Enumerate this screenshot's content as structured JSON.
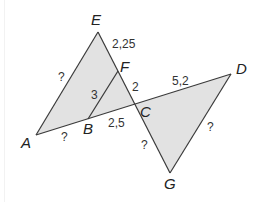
{
  "diagram": {
    "type": "geometry-figure",
    "colors": {
      "fill": "#e2e2e2",
      "stroke": "#3a3a3a",
      "text": "#222222"
    },
    "points": {
      "A": {
        "x": 36,
        "y": 135
      },
      "B": {
        "x": 88,
        "y": 119
      },
      "C": {
        "x": 135,
        "y": 104
      },
      "D": {
        "x": 231,
        "y": 74
      },
      "E": {
        "x": 98,
        "y": 32
      },
      "F": {
        "x": 118,
        "y": 71
      },
      "G": {
        "x": 170,
        "y": 173
      }
    },
    "vertex_labels": {
      "A": "A",
      "B": "B",
      "C": "C",
      "D": "D",
      "E": "E",
      "F": "F",
      "G": "G"
    },
    "measure_labels": {
      "EF": "2,25",
      "FC": "2",
      "BF": "3",
      "BC": "2,5",
      "CD": "5,2",
      "AE": "?",
      "AB": "?",
      "CG": "?",
      "DG": "?"
    },
    "shapes": [
      {
        "name": "triangle-AEC",
        "vertices": [
          "A",
          "E",
          "C"
        ]
      },
      {
        "name": "triangle-CDG",
        "vertices": [
          "C",
          "D",
          "G"
        ]
      }
    ],
    "segments": [
      "AD",
      "EG",
      "BF",
      "AE",
      "DG"
    ]
  }
}
